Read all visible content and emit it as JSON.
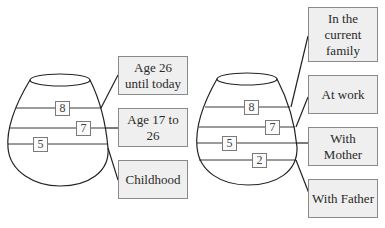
{
  "diagrams": [
    {
      "name": "vase-by-life-period",
      "layers": [
        {
          "value": "8",
          "label": "Age 26 until today"
        },
        {
          "value": "7",
          "label": "Age 17 to 26"
        },
        {
          "value": "5",
          "label": "Childhood"
        }
      ]
    },
    {
      "name": "vase-by-context",
      "layers": [
        {
          "value": "8",
          "label": "In the current family"
        },
        {
          "value": "7",
          "label": "At work"
        },
        {
          "value": "5",
          "label": "With Mother"
        },
        {
          "value": "2",
          "label": "With Father"
        }
      ]
    }
  ],
  "colors": {
    "box_fill": "#efefef",
    "box_border": "#8a8a8a",
    "line": "#222222"
  }
}
